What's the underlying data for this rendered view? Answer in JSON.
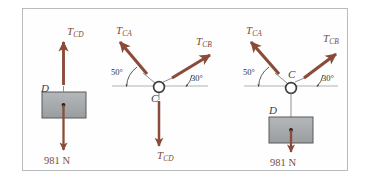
{
  "figure": {
    "background": "#ffffff",
    "frame_color": "#b9bbbd",
    "arrow_color": "#8a4b38",
    "block_fill": "#a9acae",
    "block_edge": "#58585a",
    "label_color": "#7d4b3c",
    "ground_line_color": "#b0b2b4"
  },
  "diagrams": [
    {
      "id": "left-free-body-D",
      "point_labels": {
        "d": "D"
      },
      "forces": [
        {
          "name": "T_CD",
          "base": "T",
          "sub": "CD",
          "direction": "up"
        },
        {
          "name": "weight",
          "value": "981 N",
          "direction": "down"
        }
      ]
    },
    {
      "id": "middle-free-body-C",
      "point_labels": {
        "c": "C"
      },
      "angles": {
        "left": "50°",
        "right": "30°"
      },
      "forces": [
        {
          "name": "T_CA",
          "base": "T",
          "sub": "CA",
          "direction": "up-left"
        },
        {
          "name": "T_CB",
          "base": "T",
          "sub": "CB",
          "direction": "up-right"
        },
        {
          "name": "T_CD",
          "base": "T",
          "sub": "CD",
          "direction": "down"
        }
      ]
    },
    {
      "id": "right-combined-CD",
      "point_labels": {
        "c": "C",
        "d": "D"
      },
      "angles": {
        "left": "50°",
        "right": "30°"
      },
      "forces": [
        {
          "name": "T_CA",
          "base": "T",
          "sub": "CA",
          "direction": "up-left"
        },
        {
          "name": "T_CB",
          "base": "T",
          "sub": "CB",
          "direction": "up-right"
        },
        {
          "name": "weight",
          "value": "981 N",
          "direction": "down"
        }
      ]
    }
  ],
  "labels": {
    "left": {
      "tcd_base": "T",
      "tcd_sub": "CD",
      "d": "D",
      "weight": "981 N"
    },
    "middle": {
      "tca_base": "T",
      "tca_sub": "CA",
      "tcb_base": "T",
      "tcb_sub": "CB",
      "tcd_base": "T",
      "tcd_sub": "CD",
      "c": "C",
      "angle_left": "50°",
      "angle_right": "30°"
    },
    "right": {
      "tca_base": "T",
      "tca_sub": "CA",
      "tcb_base": "T",
      "tcb_sub": "CB",
      "c": "C",
      "d": "D",
      "angle_left": "50°",
      "angle_right": "30°",
      "weight": "981 N"
    }
  }
}
